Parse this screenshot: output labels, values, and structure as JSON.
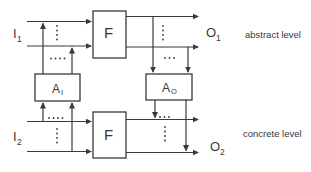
{
  "figure": {
    "type": "block-diagram",
    "levels": {
      "abstract_label": "abstract level",
      "concrete_label": "concrete level"
    },
    "blocks": {
      "f_abstract": {
        "label": "F"
      },
      "f_concrete": {
        "label": "F"
      },
      "a_input": {
        "base": "A",
        "sub": "I"
      },
      "a_output": {
        "base": "A",
        "sub": "O"
      }
    },
    "signals": {
      "i1": {
        "base": "I",
        "sub": "1"
      },
      "i2": {
        "base": "I",
        "sub": "2"
      },
      "o1": {
        "base": "O",
        "sub": "1"
      },
      "o2": {
        "base": "O",
        "sub": "2"
      }
    },
    "colors": {
      "line": "#3a3a3a",
      "text": "#383838",
      "background": "#ffffff"
    }
  }
}
